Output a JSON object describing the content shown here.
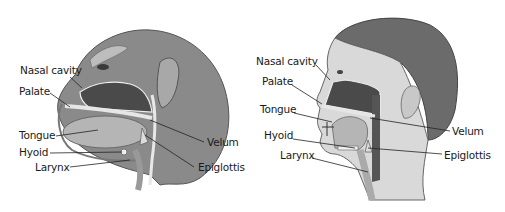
{
  "figures": [
    {
      "subject": "chimpanzee",
      "labels": {
        "nasal_cavity": "Nasal cavity",
        "palate": "Palate",
        "tongue": "Tongue",
        "hyoid": "Hyoid",
        "larynx": "Larynx",
        "velum": "Velum",
        "epiglottis": "Epiglottis"
      }
    },
    {
      "subject": "human",
      "labels": {
        "nasal_cavity": "Nasal cavity",
        "palate": "Palate",
        "tongue": "Tongue",
        "hyoid": "Hyoid",
        "larynx": "Larynx",
        "velum": "Velum",
        "epiglottis": "Epiglottis"
      }
    }
  ],
  "colors": {
    "background": "#ffffff",
    "label_text": "#1a1a1a",
    "leader_line": "#222222",
    "cavity_dark": "#4a4a4a",
    "skin": "#d9d9d9",
    "hair": "#6b6b6b"
  }
}
